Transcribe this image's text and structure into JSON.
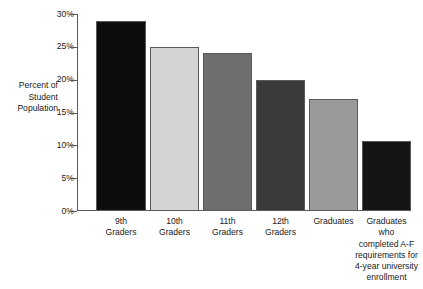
{
  "chart_data": {
    "type": "bar",
    "title": "",
    "subtitle": "",
    "xlabel": "",
    "ylabel": "Percent of Student Population",
    "ylabel_lines": [
      "Percent of",
      "Student",
      "Population"
    ],
    "ylim": [
      0,
      30
    ],
    "y_ticks": [
      0,
      5,
      10,
      15,
      20,
      25,
      30
    ],
    "y_tick_labels": [
      "0%",
      "5%",
      "10%",
      "15%",
      "20%",
      "25%",
      "30%"
    ],
    "grid": false,
    "legend": "none",
    "value_suffix": "%",
    "categories": [
      "9th Graders",
      "10th Graders",
      "11th Graders",
      "12th Graders",
      "Graduates",
      "Graduates who completed A-F requirements for 4-year university enrollment"
    ],
    "category_lines": [
      [
        "9th",
        "Graders"
      ],
      [
        "10th",
        "Graders"
      ],
      [
        "11th",
        "Graders"
      ],
      [
        "12th",
        "Graders"
      ],
      [
        "Graduates"
      ],
      [
        "Graduates",
        "who",
        "completed A-F",
        "requirements for",
        "4-year university",
        "enrollment"
      ]
    ],
    "values": [
      29,
      25,
      24,
      20,
      17,
      10.7
    ],
    "bar_colors": [
      "#0d0d0d",
      "#d4d4d4",
      "#6e6e6e",
      "#3a3a3a",
      "#9a9a9a",
      "#151515"
    ],
    "bar_edge_color": "#58595b",
    "axis_color": "#58595b",
    "background_color": "#ffffff"
  }
}
